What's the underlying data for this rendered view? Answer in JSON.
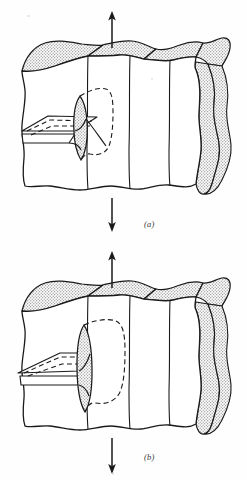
{
  "figure": {
    "kind": "line-drawing",
    "background_color": "#fefefe",
    "ink_color": "#1a1a1a",
    "shade_color": "#d9d9d9",
    "panel_count": 2
  },
  "panels": [
    {
      "id": "a",
      "caption": "(a)",
      "arrows": [
        {
          "name": "top-tension-arrow",
          "direction": "up",
          "x": 112,
          "from_y": 48,
          "to_y": 14
        },
        {
          "name": "bottom-tension-arrow",
          "direction": "down",
          "x": 112,
          "from_y": 198,
          "to_y": 230
        }
      ],
      "block": {
        "label": "cracked-plate-block",
        "top_face_shaded": true,
        "right_face_shaded": true,
        "vertical_division_lines_x": [
          88,
          130,
          170
        ],
        "crack": {
          "label": "surface-notch-and-crack-front",
          "front_shape": "lens-ellipse",
          "front_center_x": 80,
          "front_center_y": 128,
          "front_half_width": 11,
          "front_half_height": 33,
          "state": "small penny-shaped flaw"
        }
      }
    },
    {
      "id": "b",
      "caption": "(b)",
      "arrows": [
        {
          "name": "top-tension-arrow",
          "direction": "up",
          "x": 112,
          "from_y": 48,
          "to_y": 14
        },
        {
          "name": "bottom-tension-arrow",
          "direction": "down",
          "x": 112,
          "from_y": 198,
          "to_y": 232
        }
      ],
      "block": {
        "label": "cracked-plate-block",
        "top_face_shaded": true,
        "right_face_shaded": true,
        "vertical_division_lines_x": [
          88,
          130,
          170
        ],
        "crack": {
          "label": "surface-notch-and-crack-front",
          "front_shape": "lens-ellipse",
          "front_center_x": 84,
          "front_center_y": 128,
          "front_half_width": 12,
          "front_half_height": 43,
          "state": "enlarged crack front after growth"
        }
      }
    }
  ]
}
